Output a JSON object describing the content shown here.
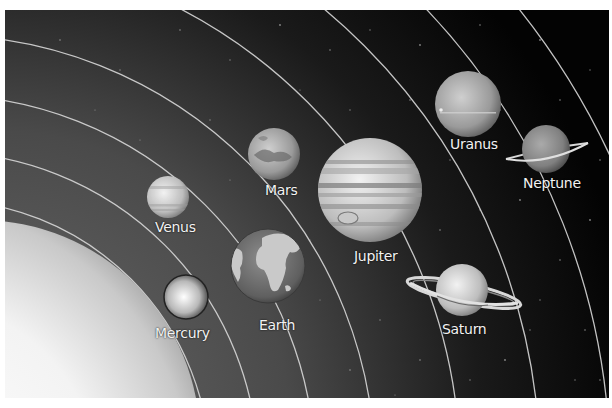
{
  "illustration": {
    "subject": "Solar system diagram",
    "style": "grayscale",
    "colors": {
      "frame": "#ffffff",
      "space_light": "#5a5a5a",
      "space_dark": "#050505",
      "orbit_line": "#d8d8d8",
      "label_text": "#f2f2f2"
    },
    "sun": {
      "label": ""
    },
    "planets": [
      {
        "name": "Mercury",
        "label": "Mercury"
      },
      {
        "name": "Venus",
        "label": "Venus"
      },
      {
        "name": "Earth",
        "label": "Earth"
      },
      {
        "name": "Mars",
        "label": "Mars"
      },
      {
        "name": "Jupiter",
        "label": "Jupiter"
      },
      {
        "name": "Saturn",
        "label": "Saturn"
      },
      {
        "name": "Uranus",
        "label": "Uranus"
      },
      {
        "name": "Neptune",
        "label": "Neptune"
      }
    ]
  }
}
